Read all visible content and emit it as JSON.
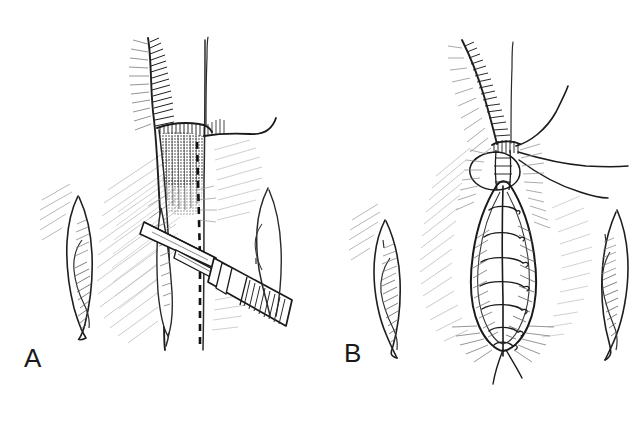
{
  "figure": {
    "type": "medical-line-illustration",
    "technique": "pen-and-ink hatching",
    "background_color": "#ffffff",
    "ink_color": "#1a1a1a",
    "hatch_color": "#555555",
    "panel_count": 2
  },
  "panels": [
    {
      "id": "A",
      "label": "A",
      "stage": "incision",
      "structures": [
        {
          "name": "left-labial-fold",
          "position": "left-lateral"
        },
        {
          "name": "right-labial-fold",
          "position": "right-lateral"
        },
        {
          "name": "midline-raphe",
          "position": "center"
        },
        {
          "name": "anal-verge-shading",
          "position": "center-superior"
        },
        {
          "name": "dashed-incision-line",
          "position": "center-vertical"
        },
        {
          "name": "scalpel",
          "position": "center-inferior-right"
        }
      ]
    },
    {
      "id": "B",
      "label": "B",
      "stage": "closure",
      "structures": [
        {
          "name": "left-labial-fold",
          "position": "left-lateral"
        },
        {
          "name": "right-labial-fold",
          "position": "right-lateral"
        },
        {
          "name": "repaired-wound",
          "position": "center"
        },
        {
          "name": "interrupted-sutures",
          "count": 7,
          "position": "center-vertical"
        },
        {
          "name": "suture-tails",
          "position": "center-superior-right"
        }
      ]
    }
  ],
  "labels": {
    "panel_a": "A",
    "panel_b": "B"
  },
  "colors": {
    "background": "#ffffff",
    "ink": "#1a1a1a",
    "hatch_light": "#7a7a7a",
    "hatch_mid": "#4a4a4a",
    "stipple_dark": "#111111"
  }
}
